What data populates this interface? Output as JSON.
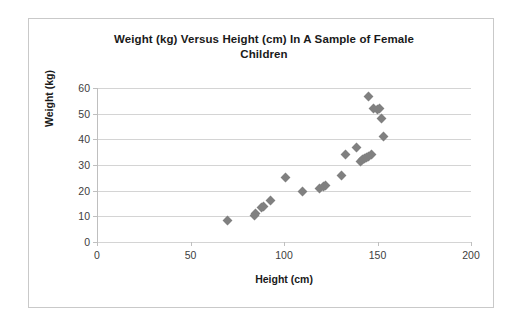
{
  "chart_data": {
    "type": "scatter",
    "title": "Weight (kg) Versus Height (cm) In A Sample of Female Children",
    "title_line1": "Weight (kg) Versus Height (cm) In A Sample of Female",
    "title_line2": "Children",
    "xlabel": "Height (cm)",
    "ylabel": "Weight (kg)",
    "xlim": [
      0,
      200
    ],
    "ylim": [
      0,
      60
    ],
    "xticks": [
      0,
      50,
      100,
      150,
      200
    ],
    "yticks": [
      0,
      10,
      20,
      30,
      40,
      50,
      60
    ],
    "xtick_labels": [
      "0",
      "50",
      "100",
      "150",
      "200"
    ],
    "ytick_labels": [
      "0",
      "10",
      "20",
      "30",
      "40",
      "50",
      "60"
    ],
    "grid": "horizontal",
    "legend": "none",
    "marker_shape": "diamond",
    "marker_color": "#808080",
    "x": [
      70,
      84,
      85,
      88,
      89,
      93,
      101,
      110,
      119,
      121,
      122,
      131,
      133,
      139,
      141,
      142,
      143,
      144,
      145,
      145,
      147,
      148,
      150,
      151,
      152,
      153
    ],
    "y": [
      8.5,
      10.5,
      11,
      13.5,
      14,
      16,
      25,
      19.5,
      21,
      21.5,
      22,
      26,
      34,
      37,
      31.5,
      32,
      32.5,
      33,
      33.5,
      56.5,
      34,
      52,
      51.5,
      52,
      48,
      41
    ],
    "points": [
      {
        "x": 70,
        "y": 8.5
      },
      {
        "x": 84,
        "y": 10.5
      },
      {
        "x": 85,
        "y": 11
      },
      {
        "x": 88,
        "y": 13.5
      },
      {
        "x": 89,
        "y": 14
      },
      {
        "x": 93,
        "y": 16
      },
      {
        "x": 101,
        "y": 25
      },
      {
        "x": 110,
        "y": 19.5
      },
      {
        "x": 119,
        "y": 21
      },
      {
        "x": 121,
        "y": 21.5
      },
      {
        "x": 122,
        "y": 22
      },
      {
        "x": 131,
        "y": 26
      },
      {
        "x": 133,
        "y": 34
      },
      {
        "x": 139,
        "y": 37
      },
      {
        "x": 141,
        "y": 31.5
      },
      {
        "x": 142,
        "y": 32
      },
      {
        "x": 143,
        "y": 32.5
      },
      {
        "x": 144,
        "y": 33
      },
      {
        "x": 145,
        "y": 33.5
      },
      {
        "x": 145,
        "y": 56.5
      },
      {
        "x": 147,
        "y": 34
      },
      {
        "x": 148,
        "y": 52
      },
      {
        "x": 150,
        "y": 51.5
      },
      {
        "x": 151,
        "y": 52
      },
      {
        "x": 152,
        "y": 48
      },
      {
        "x": 153,
        "y": 41
      }
    ],
    "colors": {
      "marker": "#808080",
      "gridline": "#d4d4d4",
      "axis": "#bfbfbf",
      "text": "#1a1a1a",
      "tick_text": "#404040",
      "frame": "#c9c9c9",
      "background": "#ffffff"
    }
  }
}
